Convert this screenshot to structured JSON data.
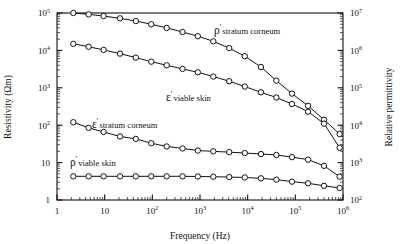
{
  "figure": {
    "xlabel": "Frequency (Hz)",
    "ylabel_left": "Resistivity (Ωm)",
    "ylabel_right": "Relative permittivity"
  },
  "axes": {
    "x_ticks": [
      {
        "mant": "1",
        "exp": ""
      },
      {
        "mant": "10",
        "exp": ""
      },
      {
        "mant": "10",
        "exp": "2"
      },
      {
        "mant": "10",
        "exp": "3"
      },
      {
        "mant": "10",
        "exp": "4"
      },
      {
        "mant": "10",
        "exp": "5"
      },
      {
        "mant": "10",
        "exp": "6"
      }
    ],
    "y_left_ticks": [
      {
        "mant": "1",
        "exp": ""
      },
      {
        "mant": "10",
        "exp": ""
      },
      {
        "mant": "10",
        "exp": "2"
      },
      {
        "mant": "10",
        "exp": "3"
      },
      {
        "mant": "10",
        "exp": "4"
      },
      {
        "mant": "10",
        "exp": "5"
      }
    ],
    "y_right_ticks": [
      {
        "mant": "10",
        "exp": "2"
      },
      {
        "mant": "10",
        "exp": "3"
      },
      {
        "mant": "10",
        "exp": "4"
      },
      {
        "mant": "10",
        "exp": "5"
      },
      {
        "mant": "10",
        "exp": "6"
      },
      {
        "mant": "10",
        "exp": "7"
      }
    ]
  },
  "annotations": [
    {
      "id": "rho-stratum-corneum",
      "symbol": "ρ",
      "prime": "'",
      "text": "stratum corneum",
      "x": 214,
      "y": 34
    },
    {
      "id": "eps-viable-skin",
      "symbol": "ε",
      "prime": "'",
      "text": "viable skin",
      "x": 166,
      "y": 101
    },
    {
      "id": "eps-stratum-corneum",
      "symbol": "ε",
      "prime": "'",
      "text": "stratum corneum",
      "x": 92,
      "y": 128
    },
    {
      "id": "rho-viable-skin",
      "symbol": "ρ",
      "prime": "'",
      "text": "viable skin",
      "x": 70,
      "y": 166
    }
  ],
  "chart_data": {
    "type": "line",
    "title": "",
    "xlabel": "Frequency (Hz)",
    "ylabel": "Resistivity (Ωm)",
    "ylabel_secondary": "Relative permittivity",
    "xscale": "log",
    "yscale": "log",
    "xlim": [
      1,
      1000000
    ],
    "ylim": [
      1,
      100000
    ],
    "ylim_secondary": [
      100,
      10000000
    ],
    "grid": false,
    "legend": "inline-annotations",
    "marker": "open-circle",
    "series": [
      {
        "name": "ρ' stratum corneum",
        "axis": "left",
        "units": "Ωm",
        "x": [
          2.2,
          4.6,
          9.5,
          21,
          45,
          95,
          200,
          430,
          900,
          1900,
          4100,
          8700,
          19000,
          40000,
          85000,
          185000,
          400000,
          850000
        ],
        "y": [
          100000,
          92000,
          83000,
          72000,
          61000,
          50000,
          40000,
          31000,
          24000,
          17500,
          11500,
          7000,
          3600,
          1550,
          700,
          330,
          140,
          58
        ]
      },
      {
        "name": "ε' viable skin",
        "axis": "right",
        "units": "relative permittivity",
        "x": [
          2.2,
          4.6,
          9.5,
          21,
          45,
          95,
          200,
          430,
          900,
          1900,
          4100,
          8700,
          19000,
          40000,
          85000,
          185000,
          400000,
          850000
        ],
        "y_left_equivalent": [
          15000,
          12500,
          10300,
          8200,
          6400,
          5000,
          4000,
          3200,
          2600,
          2000,
          1500,
          1080,
          760,
          550,
          370,
          230,
          110,
          25
        ],
        "y": [
          1500000,
          1250000,
          1030000,
          820000,
          640000,
          500000,
          400000,
          320000,
          260000,
          200000,
          150000,
          108000,
          76000,
          55000,
          37000,
          23000,
          11000,
          2500
        ]
      },
      {
        "name": "ε' stratum corneum",
        "axis": "right",
        "units": "relative permittivity",
        "x": [
          2.2,
          4.6,
          9.5,
          21,
          45,
          95,
          200,
          430,
          900,
          1900,
          4100,
          8700,
          19000,
          40000,
          85000,
          185000,
          400000,
          850000
        ],
        "y_left_equivalent": [
          120,
          85,
          66,
          50,
          43,
          33,
          27,
          24,
          21,
          20,
          19,
          18,
          17,
          16,
          14,
          12,
          8.2,
          4.2
        ],
        "y": [
          12000,
          8500,
          6600,
          5000,
          4300,
          3300,
          2700,
          2400,
          2100,
          2000,
          1900,
          1800,
          1700,
          1600,
          1400,
          1200,
          820,
          420
        ]
      },
      {
        "name": "ρ' viable skin",
        "axis": "left",
        "units": "Ωm",
        "x": [
          2.2,
          4.6,
          9.5,
          21,
          45,
          95,
          200,
          430,
          900,
          1900,
          4100,
          8700,
          19000,
          40000,
          85000,
          185000,
          400000,
          850000
        ],
        "y": [
          4.3,
          4.3,
          4.3,
          4.3,
          4.3,
          4.3,
          4.3,
          4.3,
          4.25,
          4.2,
          4.1,
          4.0,
          3.8,
          3.5,
          3.1,
          2.8,
          2.4,
          2.1
        ]
      }
    ]
  }
}
